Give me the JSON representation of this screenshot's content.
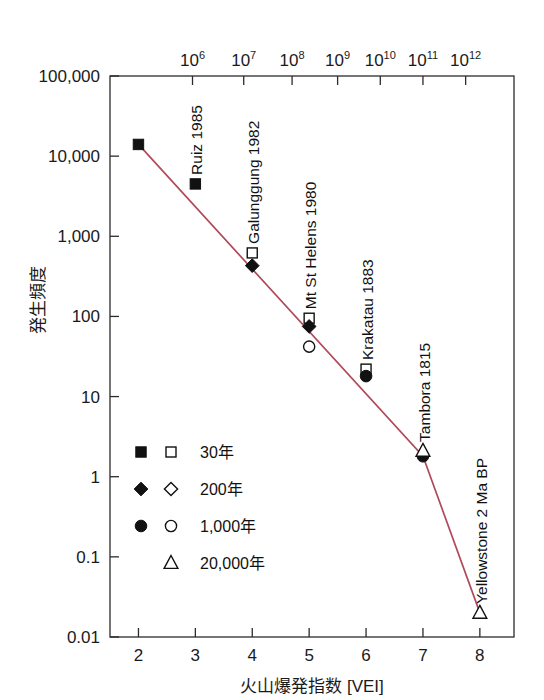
{
  "chart_data": {
    "type": "scatter",
    "title": "",
    "xlabel": "火山爆発指数 [VEI]",
    "ylabel": "発生頻度",
    "top_axis_label": "",
    "xlim": [
      1.5,
      8.6
    ],
    "ylim": [
      0.01,
      100000
    ],
    "yscale": "log",
    "grid": false,
    "legend_position": "inside-lower-left",
    "x_ticks": [
      "2",
      "3",
      "4",
      "5",
      "6",
      "7",
      "8"
    ],
    "x_tick_values": [
      2,
      3,
      4,
      5,
      6,
      7,
      8
    ],
    "y_ticks": [
      "100,000",
      "10,000",
      "1,000",
      "100",
      "10",
      "1",
      "0.1",
      "0.01"
    ],
    "y_tick_values": [
      100000,
      10000,
      1000,
      100,
      10,
      1,
      0.1,
      0.01
    ],
    "top_ticks": [
      {
        "mantissa": "10",
        "exponent": "6",
        "x": 2.95
      },
      {
        "mantissa": "10",
        "exponent": "7",
        "x": 3.85
      },
      {
        "mantissa": "10",
        "exponent": "8",
        "x": 4.7
      },
      {
        "mantissa": "10",
        "exponent": "9",
        "x": 5.5
      },
      {
        "mantissa": "10",
        "exponent": "10",
        "x": 6.25
      },
      {
        "mantissa": "10",
        "exponent": "11",
        "x": 7.0
      },
      {
        "mantissa": "10",
        "exponent": "12",
        "x": 7.75
      }
    ],
    "trend_line": [
      {
        "x": 2.0,
        "y": 14000
      },
      {
        "x": 7.0,
        "y": 1.8
      },
      {
        "x": 8.0,
        "y": 0.02
      }
    ],
    "series": [
      {
        "name": "30年",
        "marker_filled": "square",
        "marker_open": "square",
        "points_filled": [
          {
            "x": 2,
            "y": 14000
          },
          {
            "x": 3,
            "y": 4500
          }
        ],
        "points_open": [
          {
            "x": 4,
            "y": 620
          },
          {
            "x": 5,
            "y": 95
          },
          {
            "x": 6,
            "y": 22
          }
        ]
      },
      {
        "name": "200年",
        "marker_filled": "diamond",
        "marker_open": "diamond",
        "points_filled": [
          {
            "x": 4,
            "y": 430
          },
          {
            "x": 5,
            "y": 75
          }
        ],
        "points_open": []
      },
      {
        "name": "1,000年",
        "marker_filled": "circle",
        "marker_open": "circle",
        "points_filled": [
          {
            "x": 6,
            "y": 18
          },
          {
            "x": 7,
            "y": 1.8
          }
        ],
        "points_open": [
          {
            "x": 5,
            "y": 42
          }
        ]
      },
      {
        "name": "20,000年",
        "marker_filled": null,
        "marker_open": "triangle",
        "points_filled": [],
        "points_open": [
          {
            "x": 7,
            "y": 2.1
          },
          {
            "x": 8,
            "y": 0.02
          }
        ]
      }
    ],
    "annotations": [
      {
        "text": "Ruiz 1985",
        "x": 3,
        "y": 4500
      },
      {
        "text": "Galunggung 1982",
        "x": 4,
        "y": 620
      },
      {
        "text": "Mt St Helens 1980",
        "x": 5,
        "y": 95
      },
      {
        "text": "Krakatau 1883",
        "x": 6,
        "y": 22
      },
      {
        "text": "Tambora 1815",
        "x": 7,
        "y": 2.1
      },
      {
        "text": "Yellowstone 2 Ma BP",
        "x": 8,
        "y": 0.02
      }
    ],
    "legend": [
      {
        "label": "30年",
        "filled": "square",
        "open": "square"
      },
      {
        "label": "200年",
        "filled": "diamond",
        "open": "diamond"
      },
      {
        "label": "1,000年",
        "filled": "circle",
        "open": "circle"
      },
      {
        "label": "20,000年",
        "filled": null,
        "open": "triangle"
      }
    ],
    "colors": {
      "trend_line": "#b04a5a",
      "axis": "#2b2b2b",
      "marker": "#111111",
      "background": "#ffffff"
    }
  }
}
